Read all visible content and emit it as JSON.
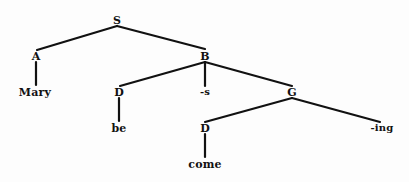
{
  "diagram": {
    "type": "syntax-tree",
    "title": "",
    "background_color": "#fdfdfd",
    "line_color": "#111111",
    "text_color": "#111111",
    "nodes": [
      {
        "id": "S",
        "label": "S",
        "kind": "category",
        "x": 117,
        "y": 20
      },
      {
        "id": "A",
        "label": "A",
        "kind": "category",
        "x": 36,
        "y": 56
      },
      {
        "id": "B",
        "label": "B",
        "kind": "category",
        "x": 205,
        "y": 56
      },
      {
        "id": "Mary",
        "label": "Mary",
        "kind": "leaf",
        "x": 35,
        "y": 92
      },
      {
        "id": "D1",
        "label": "D",
        "kind": "category",
        "x": 119,
        "y": 92
      },
      {
        "id": "affS",
        "label": "-s",
        "kind": "affix",
        "x": 205,
        "y": 92
      },
      {
        "id": "G",
        "label": "G",
        "kind": "category",
        "x": 292,
        "y": 92
      },
      {
        "id": "be",
        "label": "be",
        "kind": "leaf",
        "x": 119,
        "y": 128
      },
      {
        "id": "D2",
        "label": "D",
        "kind": "category",
        "x": 205,
        "y": 128
      },
      {
        "id": "affIng",
        "label": "-ing",
        "kind": "affix",
        "x": 382,
        "y": 128
      },
      {
        "id": "come",
        "label": "come",
        "kind": "leaf",
        "x": 205,
        "y": 164
      }
    ],
    "edges": [
      {
        "from": "S",
        "to": "A",
        "x1": 117,
        "y1": 26,
        "x2": 37,
        "y2": 50
      },
      {
        "from": "S",
        "to": "B",
        "x1": 117,
        "y1": 26,
        "x2": 205,
        "y2": 49
      },
      {
        "from": "A",
        "to": "Mary",
        "x1": 36,
        "y1": 62,
        "x2": 36,
        "y2": 85
      },
      {
        "from": "B",
        "to": "D1",
        "x1": 205,
        "y1": 62,
        "x2": 120,
        "y2": 86
      },
      {
        "from": "B",
        "to": "affS",
        "x1": 205,
        "y1": 62,
        "x2": 205,
        "y2": 86
      },
      {
        "from": "B",
        "to": "G",
        "x1": 205,
        "y1": 62,
        "x2": 292,
        "y2": 86
      },
      {
        "from": "D1",
        "to": "be",
        "x1": 119,
        "y1": 98,
        "x2": 119,
        "y2": 121
      },
      {
        "from": "G",
        "to": "D2",
        "x1": 292,
        "y1": 98,
        "x2": 205,
        "y2": 122
      },
      {
        "from": "G",
        "to": "affIng",
        "x1": 292,
        "y1": 98,
        "x2": 380,
        "y2": 122
      },
      {
        "from": "D2",
        "to": "come",
        "x1": 205,
        "y1": 134,
        "x2": 205,
        "y2": 157
      }
    ]
  }
}
